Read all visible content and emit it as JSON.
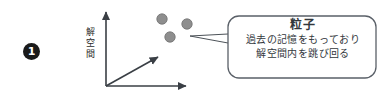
{
  "figure": {
    "bullet": {
      "label": "1"
    },
    "axes": {
      "vertical_label_chars": [
        "解",
        "空",
        "間"
      ],
      "vertical_label": "解空間",
      "stroke_color": "#3a3f45"
    },
    "particles": {
      "count": 3,
      "fill_color": "#8e8e8e",
      "stroke_color": "#6f6f6f",
      "points": [
        {
          "cx": 162,
          "cy": 19,
          "r": 5.2
        },
        {
          "cx": 187,
          "cy": 24,
          "r": 5.2
        },
        {
          "cx": 170,
          "cy": 37,
          "r": 5.2
        }
      ]
    },
    "callout": {
      "title": "粒子",
      "lines": [
        "過去の記憶をもっており",
        "解空間内を跳び回る"
      ],
      "border_color": "#5a6068",
      "fill_color": "#ffffff"
    }
  }
}
